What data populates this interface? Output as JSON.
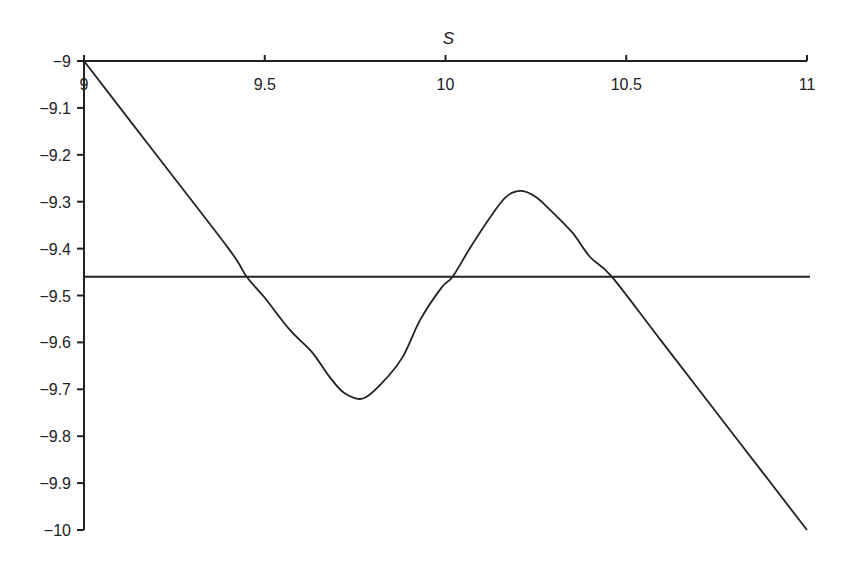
{
  "chart_data": {
    "type": "line",
    "title": "",
    "xlabel": "S",
    "ylabel": "",
    "xlim": [
      9,
      11
    ],
    "ylim": [
      -10,
      -9
    ],
    "x_axis_position": "top",
    "grid": false,
    "legend": null,
    "x_ticks": [
      9,
      9.5,
      10,
      10.5,
      11
    ],
    "x_tick_labels": [
      "9",
      "9.5",
      "10",
      "10.5",
      "11"
    ],
    "y_ticks": [
      -9,
      -9.1,
      -9.2,
      -9.3,
      -9.4,
      -9.5,
      -9.6,
      -9.7,
      -9.8,
      -9.9,
      -10
    ],
    "y_tick_labels": [
      "−9",
      "−9.1",
      "−9.2",
      "−9.3",
      "−9.4",
      "−9.5",
      "−9.6",
      "−9.7",
      "−9.8",
      "−9.9",
      "−10"
    ],
    "series": [
      {
        "name": "value curve",
        "color": "#222222",
        "x": [
          9.0,
          9.2,
          9.4,
          9.45,
          9.5,
          9.57,
          9.63,
          9.68,
          9.72,
          9.77,
          9.82,
          9.88,
          9.93,
          9.99,
          10.02,
          10.07,
          10.13,
          10.17,
          10.21,
          10.25,
          10.29,
          10.35,
          10.4,
          10.46,
          10.6,
          10.8,
          11.0
        ],
        "y": [
          -9.0,
          -9.2,
          -9.4,
          -9.46,
          -9.505,
          -9.574,
          -9.62,
          -9.674,
          -9.708,
          -9.72,
          -9.69,
          -9.633,
          -9.552,
          -9.482,
          -9.46,
          -9.396,
          -9.326,
          -9.288,
          -9.277,
          -9.29,
          -9.318,
          -9.365,
          -9.418,
          -9.46,
          -9.6,
          -9.8,
          -10.0
        ]
      },
      {
        "name": "reference level",
        "color": "#222222",
        "x": [
          9.0,
          11.0
        ],
        "y": [
          -9.46,
          -9.46
        ]
      }
    ]
  }
}
